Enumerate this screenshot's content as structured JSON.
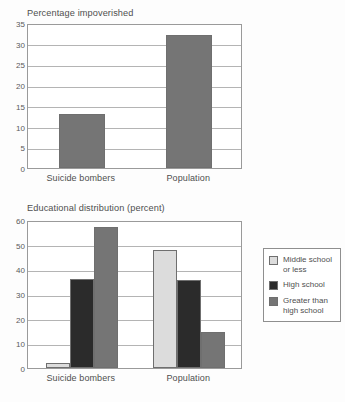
{
  "document": {
    "cut_off_top_text": "",
    "background_color": "#fdfdfd"
  },
  "palette": {
    "light_gray": "#dcdcdc",
    "dark_gray": "#2b2b2b",
    "medium_gray": "#757575",
    "bar_stroke": "#6f6f6f",
    "gridline": "#b4b4b4",
    "axis": "#9a9a9a",
    "text": "#4f4f4f"
  },
  "legend": {
    "name": "educational-distribution-legend",
    "entries": [
      {
        "label": "Middle school\nor less",
        "color": "#dcdcdc",
        "swatch_name": "legend-swatch-middle-school"
      },
      {
        "label": "High school",
        "color": "#2b2b2b",
        "swatch_name": "legend-swatch-high-school"
      },
      {
        "label": "Greater than\nhigh school",
        "color": "#757575",
        "swatch_name": "legend-swatch-greater-than-high-school"
      }
    ]
  },
  "chart_data": [
    {
      "id": "percentage-impoverished",
      "type": "bar",
      "title": "Percentage impoverished",
      "xlabel": "",
      "ylabel": "",
      "ylim": [
        0,
        35
      ],
      "yticks": [
        0,
        5,
        10,
        15,
        20,
        25,
        30,
        35
      ],
      "ytick_labels": [
        "0",
        "5",
        "10",
        "15",
        "20",
        "25",
        "30",
        "35"
      ],
      "grid": true,
      "legend_position": "none",
      "categories": [
        "Suicide bombers",
        "Population"
      ],
      "values": [
        13,
        32
      ],
      "bar_color": "#757575"
    },
    {
      "id": "educational-distribution",
      "type": "bar",
      "title": "Educational distribution (percent)",
      "xlabel": "",
      "ylabel": "",
      "ylim": [
        0,
        60
      ],
      "yticks": [
        0,
        10,
        20,
        30,
        40,
        50,
        60
      ],
      "ytick_labels": [
        "0",
        "10",
        "20",
        "30",
        "40",
        "50",
        "60"
      ],
      "grid": true,
      "legend_position": "right",
      "categories": [
        "Suicide bombers",
        "Population"
      ],
      "series": [
        {
          "name": "Middle school or less",
          "color": "#dcdcdc",
          "values": [
            2,
            48
          ]
        },
        {
          "name": "High school",
          "color": "#2b2b2b",
          "values": [
            36,
            35.5
          ]
        },
        {
          "name": "Greater than high school",
          "color": "#757575",
          "values": [
            57,
            14.5
          ]
        }
      ]
    }
  ]
}
